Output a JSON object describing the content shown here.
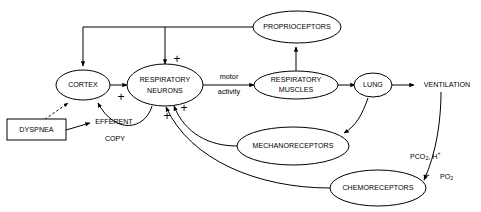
{
  "diagram": {
    "nodes": [
      {
        "id": "proprioceptors",
        "label": "PROPRIOCEPTORS",
        "shape": "ellipse"
      },
      {
        "id": "cortex",
        "label": "CORTEX",
        "shape": "ellipse"
      },
      {
        "id": "respiratory_neurons",
        "label_line1": "RESPIRATORY",
        "label_line2": "NEURONS",
        "shape": "ellipse"
      },
      {
        "id": "respiratory_muscles",
        "label_line1": "RESPIRATORY",
        "label_line2": "MUSCLES",
        "shape": "ellipse"
      },
      {
        "id": "lung",
        "label": "LUNG",
        "shape": "ellipse"
      },
      {
        "id": "mechanoreceptors",
        "label": "MECHANORECEPTORS",
        "shape": "ellipse"
      },
      {
        "id": "chemoreceptors",
        "label": "CHEMORECEPTORS",
        "shape": "ellipse"
      },
      {
        "id": "dyspnea",
        "label": "DYSPNEA",
        "shape": "rectangle"
      },
      {
        "id": "ventilation",
        "label": "VENTILATION",
        "shape": "text"
      }
    ],
    "edge_labels": {
      "motor_line1": "motor",
      "motor_line2": "activity",
      "efferent_line1": "EFFERENT",
      "efferent_line2": "COPY",
      "pco2_main": "PCO",
      "pco2_sub": "2",
      "pco2_comma": ", H",
      "pco2_sup": "+",
      "po2_main": "PO",
      "po2_sub": "2"
    },
    "signs": {
      "plus": "+",
      "minus": "−"
    },
    "colors": {
      "stroke": "#000000",
      "background": "#ffffff",
      "text": "#000000"
    }
  }
}
